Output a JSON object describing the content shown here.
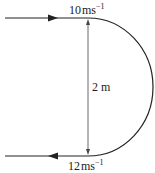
{
  "diagram": {
    "type": "U-turn path with velocities",
    "top_label": {
      "value": "10",
      "unit": "ms",
      "exponent": "−1"
    },
    "bottom_label": {
      "value": "12",
      "unit": "ms",
      "exponent": "−1"
    },
    "diameter_label": "2 m",
    "colors": {
      "line": "#222222",
      "background": "#ffffff"
    }
  }
}
